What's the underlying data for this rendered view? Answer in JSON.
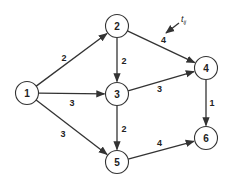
{
  "diagram": {
    "type": "directed-network",
    "annotation": {
      "label": "t",
      "subscript": "ij",
      "points_to_edge": "2-4"
    },
    "nodes": [
      {
        "id": "1",
        "label": "1"
      },
      {
        "id": "2",
        "label": "2"
      },
      {
        "id": "3",
        "label": "3"
      },
      {
        "id": "4",
        "label": "4"
      },
      {
        "id": "5",
        "label": "5"
      },
      {
        "id": "6",
        "label": "6"
      }
    ],
    "edges": [
      {
        "from": "1",
        "to": "2",
        "weight": "2"
      },
      {
        "from": "1",
        "to": "3",
        "weight": "3"
      },
      {
        "from": "1",
        "to": "5",
        "weight": "3"
      },
      {
        "from": "2",
        "to": "3",
        "weight": "2"
      },
      {
        "from": "2",
        "to": "4",
        "weight": "4"
      },
      {
        "from": "3",
        "to": "4",
        "weight": "3"
      },
      {
        "from": "3",
        "to": "5",
        "weight": "2"
      },
      {
        "from": "4",
        "to": "6",
        "weight": "1"
      },
      {
        "from": "5",
        "to": "6",
        "weight": "4"
      }
    ]
  }
}
